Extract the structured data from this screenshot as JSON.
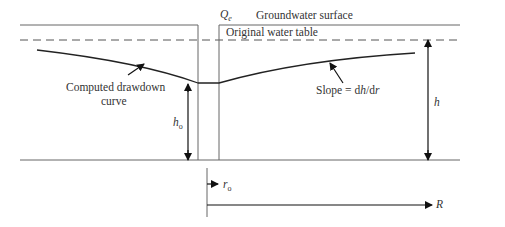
{
  "labels": {
    "qe": "Q",
    "qe_sub": "e",
    "ground_surface": "Groundwater surface",
    "original_table": "Original water table",
    "drawdown_line1": "Computed drawdown",
    "drawdown_line2": "curve",
    "slope_prefix": "Slope = d",
    "slope_h": "h",
    "slope_mid": "/d",
    "slope_r": "r",
    "h": "h",
    "ho": "h",
    "ho_sub": "o",
    "ro": "r",
    "ro_sub": "o",
    "R": "R"
  },
  "colors": {
    "line": "#333333",
    "dash": "#555555"
  }
}
